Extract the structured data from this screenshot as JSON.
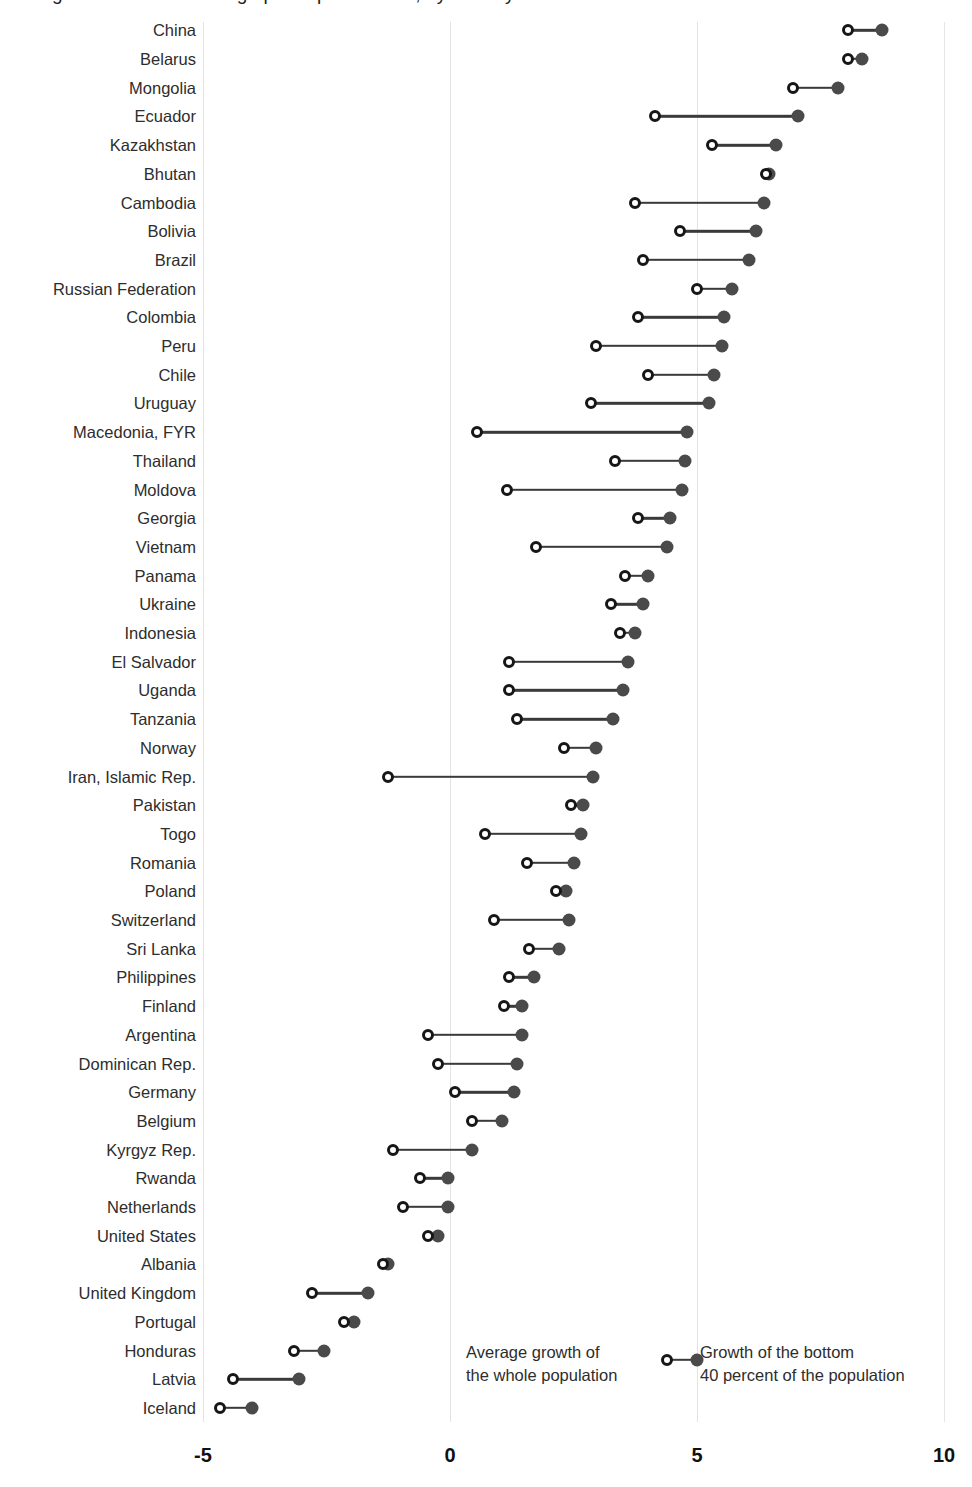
{
  "title": "Figure: Growth in average per capita income, by country",
  "axis": {
    "ticks": [
      "-5",
      "0",
      "5",
      "10"
    ],
    "tick_values": [
      -5,
      0,
      5,
      10
    ],
    "xmin": -5.8,
    "xmax": 10.6
  },
  "legend": {
    "series_a_line1": "Average growth of",
    "series_a_line2": "the whole population",
    "series_b_line1": "Growth of the bottom",
    "series_b_line2": "40 percent of the population"
  },
  "colors": {
    "filled": "#4a4a4a",
    "hollow_stroke": "#161616",
    "connector": "#3a3a3a",
    "gridline": "#e3e3e3",
    "text": "#2d2d2d"
  },
  "chart_data": {
    "type": "scatter",
    "chart_subtype": "dumbbell",
    "title": "Growth in average per capita income, by country",
    "xlabel": "",
    "ylabel": "",
    "xlim": [
      -5.8,
      10.6
    ],
    "xticks": [
      -5,
      0,
      5,
      10
    ],
    "grid": true,
    "legend_position": "bottom-center",
    "series": [
      {
        "name": "Average growth of the whole population",
        "marker": "hollow-circle"
      },
      {
        "name": "Growth of the bottom 40 percent of the population",
        "marker": "filled-circle"
      }
    ],
    "categories": [
      "China",
      "Belarus",
      "Mongolia",
      "Ecuador",
      "Kazakhstan",
      "Bhutan",
      "Cambodia",
      "Bolivia",
      "Brazil",
      "Russian Federation",
      "Colombia",
      "Peru",
      "Chile",
      "Uruguay",
      "Macedonia, FYR",
      "Thailand",
      "Moldova",
      "Georgia",
      "Vietnam",
      "Panama",
      "Ukraine",
      "Indonesia",
      "El Salvador",
      "Uganda",
      "Tanzania",
      "Norway",
      "Iran, Islamic Rep.",
      "Pakistan",
      "Togo",
      "Romania",
      "Poland",
      "Switzerland",
      "Sri Lanka",
      "Philippines",
      "Finland",
      "Argentina",
      "Dominican Rep.",
      "Germany",
      "Belgium",
      "Kyrgyz Rep.",
      "Rwanda",
      "Netherlands",
      "United States",
      "Albania",
      "United Kingdom",
      "Portugal",
      "Honduras",
      "Latvia",
      "Iceland"
    ],
    "rows": [
      {
        "country": "China",
        "average": 8.05,
        "bottom40": 8.75
      },
      {
        "country": "Belarus",
        "average": 8.05,
        "bottom40": 8.35
      },
      {
        "country": "Mongolia",
        "average": 6.95,
        "bottom40": 7.85
      },
      {
        "country": "Ecuador",
        "average": 4.15,
        "bottom40": 7.05
      },
      {
        "country": "Kazakhstan",
        "average": 5.3,
        "bottom40": 6.6
      },
      {
        "country": "Bhutan",
        "average": 6.4,
        "bottom40": 6.45
      },
      {
        "country": "Cambodia",
        "average": 3.75,
        "bottom40": 6.35
      },
      {
        "country": "Bolivia",
        "average": 4.65,
        "bottom40": 6.2
      },
      {
        "country": "Brazil",
        "average": 3.9,
        "bottom40": 6.05
      },
      {
        "country": "Russian Federation",
        "average": 5.0,
        "bottom40": 5.7
      },
      {
        "country": "Colombia",
        "average": 3.8,
        "bottom40": 5.55
      },
      {
        "country": "Peru",
        "average": 2.95,
        "bottom40": 5.5
      },
      {
        "country": "Chile",
        "average": 4.0,
        "bottom40": 5.35
      },
      {
        "country": "Uruguay",
        "average": 2.85,
        "bottom40": 5.25
      },
      {
        "country": "Macedonia, FYR",
        "average": 0.55,
        "bottom40": 4.8
      },
      {
        "country": "Thailand",
        "average": 3.35,
        "bottom40": 4.75
      },
      {
        "country": "Moldova",
        "average": 1.15,
        "bottom40": 4.7
      },
      {
        "country": "Georgia",
        "average": 3.8,
        "bottom40": 4.45
      },
      {
        "country": "Vietnam",
        "average": 1.75,
        "bottom40": 4.4
      },
      {
        "country": "Panama",
        "average": 3.55,
        "bottom40": 4.0
      },
      {
        "country": "Ukraine",
        "average": 3.25,
        "bottom40": 3.9
      },
      {
        "country": "Indonesia",
        "average": 3.45,
        "bottom40": 3.75
      },
      {
        "country": "El Salvador",
        "average": 1.2,
        "bottom40": 3.6
      },
      {
        "country": "Uganda",
        "average": 1.2,
        "bottom40": 3.5
      },
      {
        "country": "Tanzania",
        "average": 1.35,
        "bottom40": 3.3
      },
      {
        "country": "Norway",
        "average": 2.3,
        "bottom40": 2.95
      },
      {
        "country": "Iran, Islamic Rep.",
        "average": -1.25,
        "bottom40": 2.9
      },
      {
        "country": "Pakistan",
        "average": 2.45,
        "bottom40": 2.7
      },
      {
        "country": "Togo",
        "average": 0.7,
        "bottom40": 2.65
      },
      {
        "country": "Romania",
        "average": 1.55,
        "bottom40": 2.5
      },
      {
        "country": "Poland",
        "average": 2.15,
        "bottom40": 2.35
      },
      {
        "country": "Switzerland",
        "average": 0.9,
        "bottom40": 2.4
      },
      {
        "country": "Sri Lanka",
        "average": 1.6,
        "bottom40": 2.2
      },
      {
        "country": "Philippines",
        "average": 1.2,
        "bottom40": 1.7
      },
      {
        "country": "Finland",
        "average": 1.1,
        "bottom40": 1.45
      },
      {
        "country": "Argentina",
        "average": -0.45,
        "bottom40": 1.45
      },
      {
        "country": "Dominican Rep.",
        "average": -0.25,
        "bottom40": 1.35
      },
      {
        "country": "Germany",
        "average": 0.1,
        "bottom40": 1.3
      },
      {
        "country": "Belgium",
        "average": 0.45,
        "bottom40": 1.05
      },
      {
        "country": "Kyrgyz Rep.",
        "average": -1.15,
        "bottom40": 0.45
      },
      {
        "country": "Rwanda",
        "average": -0.6,
        "bottom40": -0.05
      },
      {
        "country": "Netherlands",
        "average": -0.95,
        "bottom40": -0.05
      },
      {
        "country": "United States",
        "average": -0.45,
        "bottom40": -0.25
      },
      {
        "country": "Albania",
        "average": -1.35,
        "bottom40": -1.25
      },
      {
        "country": "United Kingdom",
        "average": -2.8,
        "bottom40": -1.65
      },
      {
        "country": "Portugal",
        "average": -2.15,
        "bottom40": -1.95
      },
      {
        "country": "Honduras",
        "average": -3.15,
        "bottom40": -2.55
      },
      {
        "country": "Latvia",
        "average": -4.4,
        "bottom40": -3.05
      },
      {
        "country": "Iceland",
        "average": -4.65,
        "bottom40": -4.0
      }
    ]
  }
}
